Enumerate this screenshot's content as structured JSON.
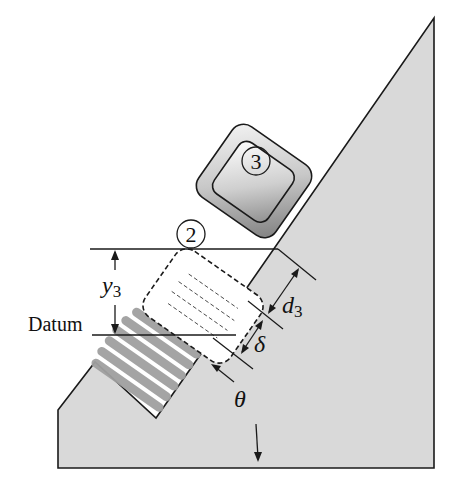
{
  "diagram": {
    "type": "mechanics-incline-spring",
    "colors": {
      "ground_fill": "#d9d9d9",
      "line": "#1a1a1a",
      "spring_gray": "#9a9a9a",
      "block_gradient_dark": "#8a8a8a",
      "block_gradient_light": "#f2f2f2"
    },
    "labels": {
      "block3": "3",
      "block2": "2",
      "y3_main": "y",
      "y3_sub": "3",
      "datum": "Datum",
      "d3_main": "d",
      "d3_sub": "3",
      "delta": "δ",
      "theta": "θ"
    }
  }
}
